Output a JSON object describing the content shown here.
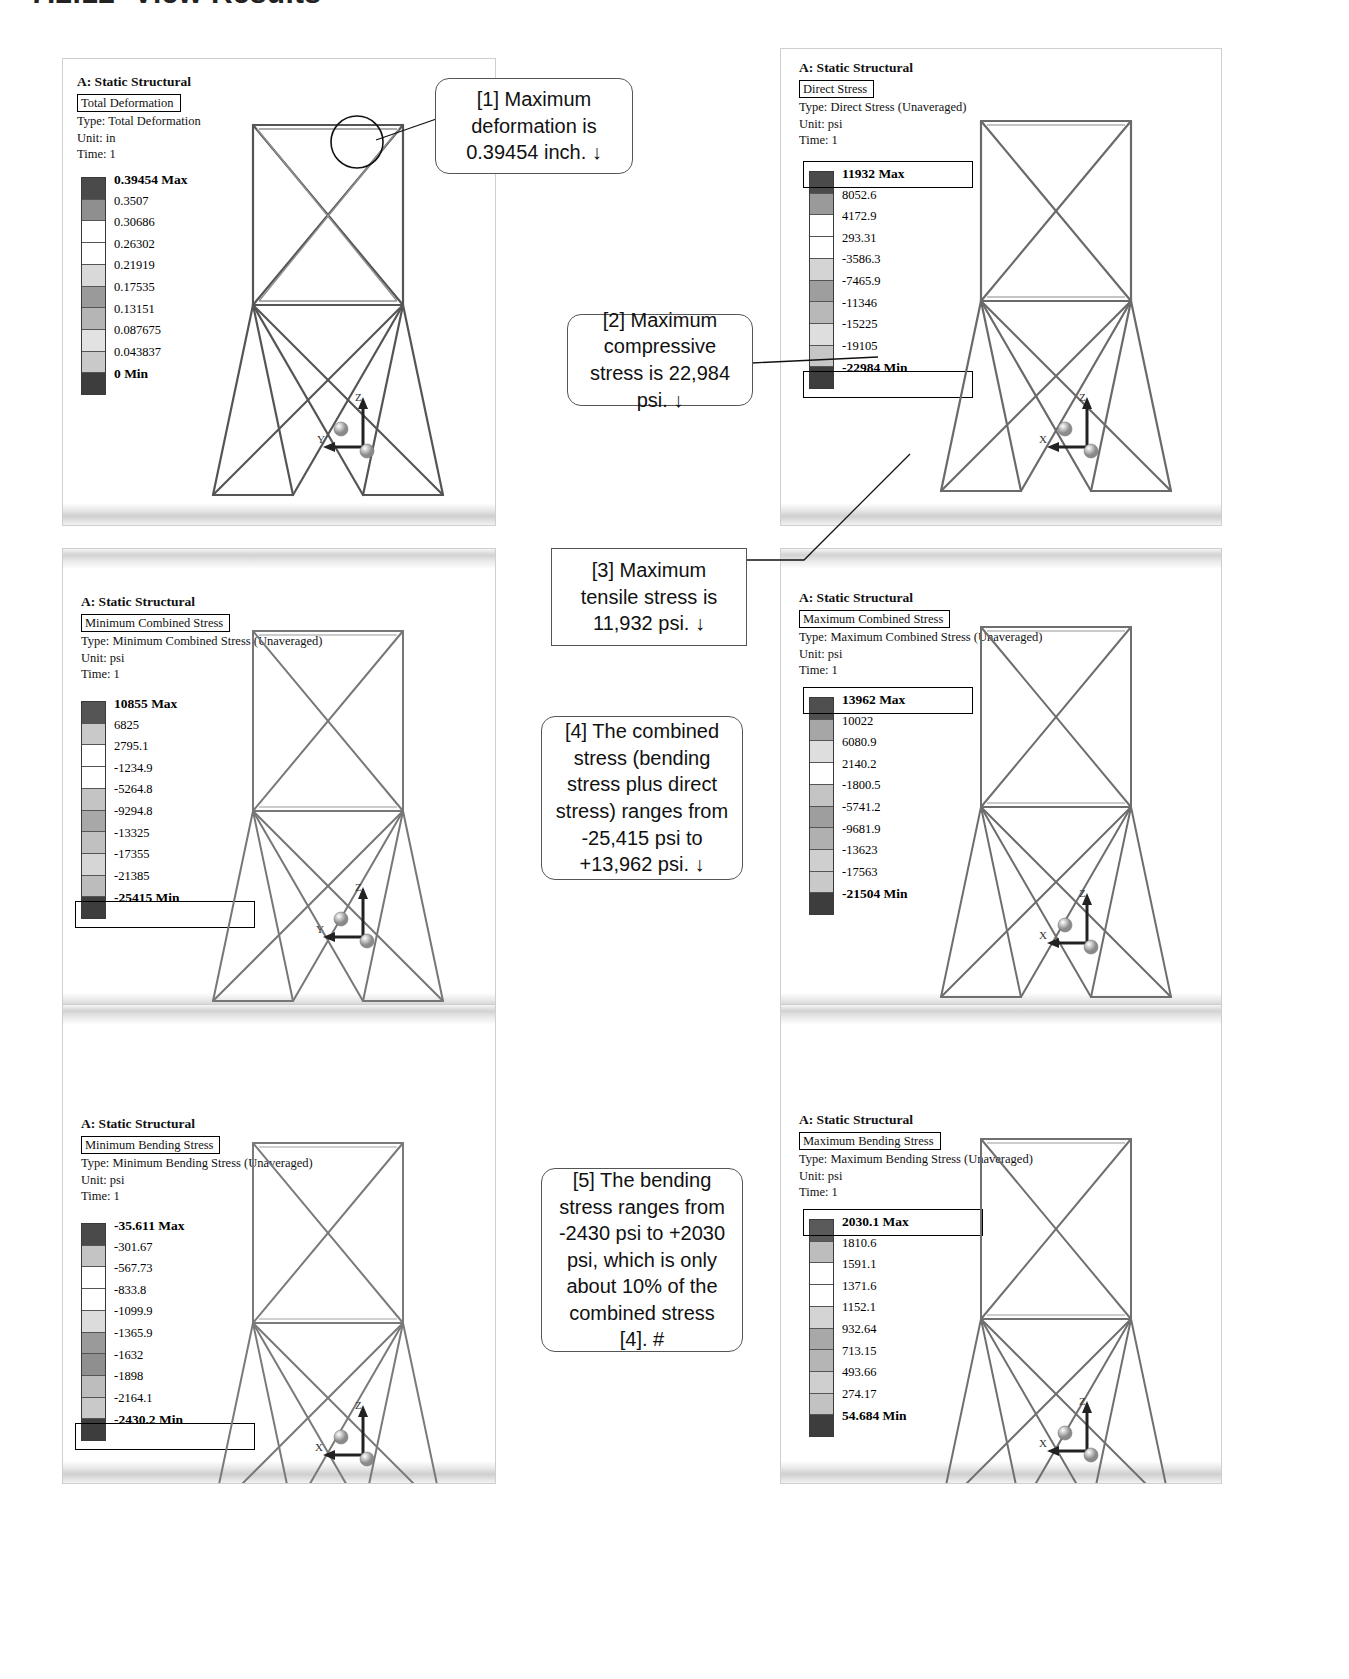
{
  "heading": {
    "number": "7.2.12",
    "title": "View Results"
  },
  "panels": [
    {
      "id": "total-deformation",
      "project": "A: Static Structural",
      "result_name": "Total Deformation",
      "type_line": "Type: Total Deformation",
      "unit_line": "Unit: in",
      "time_line": "Time: 1",
      "legend": {
        "max_label": "0.39454 Max",
        "min_label": "0 Min",
        "values": [
          "0.3507",
          "0.30686",
          "0.26302",
          "0.21919",
          "0.17535",
          "0.13151",
          "0.087675",
          "0.043837"
        ]
      }
    },
    {
      "id": "direct-stress",
      "project": "A: Static Structural",
      "result_name": "Direct Stress",
      "type_line": "Type: Direct Stress (Unaveraged)",
      "unit_line": "Unit: psi",
      "time_line": "Time: 1",
      "legend": {
        "max_label": "11932 Max",
        "min_label": "-22984 Min",
        "values": [
          "8052.6",
          "4172.9",
          "293.31",
          "-3586.3",
          "-7465.9",
          "-11346",
          "-15225",
          "-19105"
        ]
      }
    },
    {
      "id": "minimum-combined-stress",
      "project": "A: Static Structural",
      "result_name": "Minimum Combined Stress",
      "type_line": "Type: Minimum Combined Stress (Unaveraged)",
      "unit_line": "Unit: psi",
      "time_line": "Time: 1",
      "legend": {
        "max_label": "10855 Max",
        "min_label": "-25415 Min",
        "values": [
          "6825",
          "2795.1",
          "-1234.9",
          "-5264.8",
          "-9294.8",
          "-13325",
          "-17355",
          "-21385"
        ]
      }
    },
    {
      "id": "maximum-combined-stress",
      "project": "A: Static Structural",
      "result_name": "Maximum Combined Stress",
      "type_line": "Type: Maximum Combined Stress (Unaveraged)",
      "unit_line": "Unit: psi",
      "time_line": "Time: 1",
      "legend": {
        "max_label": "13962 Max",
        "min_label": "-21504 Min",
        "values": [
          "10022",
          "6080.9",
          "2140.2",
          "-1800.5",
          "-5741.2",
          "-9681.9",
          "-13623",
          "-17563"
        ]
      }
    },
    {
      "id": "minimum-bending-stress",
      "project": "A: Static Structural",
      "result_name": "Minimum Bending Stress",
      "type_line": "Type: Minimum Bending Stress (Unaveraged)",
      "unit_line": "Unit: psi",
      "time_line": "Time: 1",
      "legend": {
        "max_label": "-35.611 Max",
        "min_label": "-2430.2 Min",
        "values": [
          "-301.67",
          "-567.73",
          "-833.8",
          "-1099.9",
          "-1365.9",
          "-1632",
          "-1898",
          "-2164.1"
        ]
      }
    },
    {
      "id": "maximum-bending-stress",
      "project": "A: Static Structural",
      "result_name": "Maximum Bending Stress",
      "type_line": "Type: Maximum Bending Stress (Unaveraged)",
      "unit_line": "Unit: psi",
      "time_line": "Time: 1",
      "legend": {
        "max_label": "2030.1 Max",
        "min_label": "54.684 Min",
        "values": [
          "1810.6",
          "1591.1",
          "1371.6",
          "1152.1",
          "932.64",
          "713.15",
          "493.66",
          "274.17"
        ]
      }
    }
  ],
  "triads": [
    {
      "id": "triad-1",
      "vertical": "Z",
      "horizontal": "Y"
    },
    {
      "id": "triad-2",
      "vertical": "Z",
      "horizontal": "X"
    },
    {
      "id": "triad-3",
      "vertical": "Z",
      "horizontal": "Y"
    },
    {
      "id": "triad-4",
      "vertical": "Z",
      "horizontal": "X"
    },
    {
      "id": "triad-5",
      "vertical": "Z",
      "horizontal": "X"
    },
    {
      "id": "triad-6",
      "vertical": "Z",
      "horizontal": "X"
    }
  ],
  "callouts": [
    {
      "id": "callout-1",
      "text": "[1] Maximum deformation is 0.39454 inch. ↓"
    },
    {
      "id": "callout-2",
      "text": "[2] Maximum compressive stress is 22,984 psi. ↓"
    },
    {
      "id": "callout-3",
      "text": "[3] Maximum tensile stress is 11,932 psi. ↓"
    },
    {
      "id": "callout-4",
      "text": "[4] The combined stress (bending stress plus direct stress) ranges from -25,415 psi to +13,962 psi. ↓"
    },
    {
      "id": "callout-5",
      "text": "[5] The bending stress ranges from -2430 psi to +2030 psi, which is only about 10% of the combined stress [4].  #"
    }
  ],
  "colors": {
    "legend_swatches": [
      "#4a4a4a",
      "#777777",
      "#a8a8a8",
      "#ffffff",
      "#d9d9d9",
      "#8f8f8f",
      "#9e9e9e",
      "#bdbdbd",
      "#cccccc",
      "#3d3d3d"
    ],
    "panel_border": "#cfcfcf",
    "callout_border": "#555555"
  }
}
